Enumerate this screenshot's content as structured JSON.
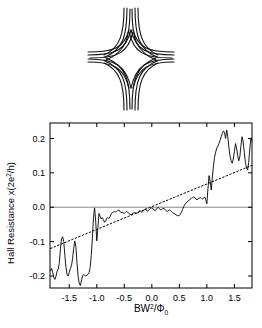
{
  "figure": {
    "device": {
      "name": "hall-cross-device-schematic",
      "description": "Hall cross with curved electron trajectories"
    },
    "chart_data": {
      "type": "line",
      "title": "",
      "subtitle": "",
      "xlabel": "BW2/Φ0",
      "xlabel_parts": {
        "base1": "BW",
        "sup": "2",
        "slash": "/Φ",
        "sub": "0"
      },
      "ylabel": "Hall Resistance x(2e2/h)",
      "ylabel_parts": {
        "text1": "Hall Resistance x(2e",
        "sup": "2",
        "text2": "/h)"
      },
      "xlim": [
        -1.85,
        1.82
      ],
      "ylim": [
        -0.235,
        0.245
      ],
      "xticks": [
        -1.5,
        -1.0,
        -0.5,
        0.0,
        0.5,
        1.0,
        1.5
      ],
      "xticklabels": [
        "-1.5",
        "-1.0",
        "-0.5",
        "0.0",
        "0.5",
        "1.0",
        "1.5"
      ],
      "yticks": [
        0.2,
        0.1,
        0.0,
        -0.1,
        -0.2
      ],
      "yticklabels": [
        "0.2",
        "0.1",
        "0.0",
        "-0.1",
        "-0.2"
      ],
      "grid": false,
      "legend": false,
      "zero_line": {
        "y": 0.0,
        "color": "#888888"
      },
      "series": [
        {
          "name": "Hall resistance trace",
          "style": "solid",
          "color": "#000000",
          "x": [
            -1.84,
            -1.82,
            -1.8,
            -1.78,
            -1.76,
            -1.74,
            -1.72,
            -1.7,
            -1.68,
            -1.66,
            -1.64,
            -1.62,
            -1.6,
            -1.58,
            -1.56,
            -1.54,
            -1.52,
            -1.5,
            -1.48,
            -1.46,
            -1.44,
            -1.42,
            -1.4,
            -1.38,
            -1.36,
            -1.34,
            -1.32,
            -1.3,
            -1.28,
            -1.26,
            -1.24,
            -1.22,
            -1.2,
            -1.18,
            -1.16,
            -1.14,
            -1.12,
            -1.1,
            -1.08,
            -1.06,
            -1.04,
            -1.02,
            -1.0,
            -0.98,
            -0.96,
            -0.94,
            -0.92,
            -0.9,
            -0.88,
            -0.86,
            -0.84,
            -0.82,
            -0.8,
            -0.78,
            -0.76,
            -0.74,
            -0.72,
            -0.7,
            -0.68,
            -0.66,
            -0.64,
            -0.62,
            -0.6,
            -0.58,
            -0.56,
            -0.54,
            -0.52,
            -0.5,
            -0.48,
            -0.46,
            -0.44,
            -0.42,
            -0.4,
            -0.38,
            -0.36,
            -0.34,
            -0.32,
            -0.3,
            -0.28,
            -0.26,
            -0.24,
            -0.22,
            -0.2,
            -0.18,
            -0.16,
            -0.14,
            -0.12,
            -0.1,
            -0.08,
            -0.06,
            -0.04,
            -0.02,
            0.0,
            0.02,
            0.04,
            0.06,
            0.08,
            0.1,
            0.12,
            0.14,
            0.16,
            0.18,
            0.2,
            0.22,
            0.24,
            0.26,
            0.28,
            0.3,
            0.32,
            0.34,
            0.36,
            0.38,
            0.4,
            0.42,
            0.44,
            0.46,
            0.48,
            0.5,
            0.52,
            0.54,
            0.56,
            0.58,
            0.6,
            0.62,
            0.64,
            0.66,
            0.68,
            0.7,
            0.72,
            0.74,
            0.76,
            0.78,
            0.8,
            0.82,
            0.84,
            0.86,
            0.88,
            0.9,
            0.92,
            0.94,
            0.96,
            0.98,
            1.0,
            1.02,
            1.04,
            1.06,
            1.08,
            1.1,
            1.12,
            1.14,
            1.16,
            1.18,
            1.2,
            1.22,
            1.24,
            1.26,
            1.28,
            1.3,
            1.32,
            1.34,
            1.36,
            1.38,
            1.4,
            1.42,
            1.44,
            1.46,
            1.48,
            1.5,
            1.52,
            1.54,
            1.56,
            1.58,
            1.6,
            1.62,
            1.64,
            1.66,
            1.68,
            1.7,
            1.72,
            1.74,
            1.76,
            1.78,
            1.8,
            1.82
          ],
          "y": [
            -0.185,
            -0.178,
            -0.19,
            -0.205,
            -0.21,
            -0.2,
            -0.186,
            -0.18,
            -0.16,
            -0.12,
            -0.092,
            -0.086,
            -0.1,
            -0.14,
            -0.175,
            -0.195,
            -0.2,
            -0.19,
            -0.178,
            -0.17,
            -0.15,
            -0.12,
            -0.098,
            -0.115,
            -0.16,
            -0.2,
            -0.22,
            -0.228,
            -0.215,
            -0.2,
            -0.196,
            -0.198,
            -0.2,
            -0.198,
            -0.195,
            -0.19,
            -0.175,
            -0.14,
            -0.09,
            -0.03,
            -0.002,
            -0.04,
            -0.098,
            -0.06,
            -0.018,
            -0.026,
            -0.034,
            -0.03,
            -0.036,
            -0.044,
            -0.04,
            -0.032,
            -0.03,
            -0.033,
            -0.028,
            -0.02,
            -0.016,
            -0.014,
            -0.012,
            -0.014,
            -0.012,
            -0.01,
            -0.008,
            -0.012,
            -0.016,
            -0.014,
            -0.016,
            -0.018,
            -0.015,
            -0.012,
            -0.014,
            -0.018,
            -0.02,
            -0.022,
            -0.02,
            -0.018,
            -0.015,
            -0.016,
            -0.018,
            -0.016,
            -0.013,
            -0.01,
            -0.012,
            -0.015,
            -0.012,
            -0.008,
            -0.005,
            -0.008,
            -0.012,
            -0.01,
            -0.006,
            -0.003,
            -0.002,
            -0.004,
            -0.008,
            -0.01,
            -0.006,
            -0.002,
            -0.001,
            -0.004,
            -0.008,
            -0.006,
            -0.003,
            -0.004,
            -0.007,
            -0.01,
            -0.012,
            -0.01,
            -0.008,
            -0.01,
            -0.013,
            -0.016,
            -0.018,
            -0.02,
            -0.022,
            -0.024,
            -0.025,
            -0.024,
            -0.02,
            -0.014,
            -0.006,
            0.002,
            0.008,
            0.012,
            0.016,
            0.018,
            0.02,
            0.024,
            0.026,
            0.028,
            0.03,
            0.028,
            0.024,
            0.022,
            0.024,
            0.026,
            0.028,
            0.026,
            0.024,
            0.026,
            0.03,
            0.022,
            0.01,
            0.055,
            0.092,
            0.075,
            0.05,
            0.088,
            0.12,
            0.145,
            0.16,
            0.172,
            0.178,
            0.185,
            0.195,
            0.205,
            0.215,
            0.222,
            0.218,
            0.2,
            0.225,
            0.205,
            0.175,
            0.15,
            0.135,
            0.128,
            0.14,
            0.162,
            0.185,
            0.172,
            0.15,
            0.135,
            0.148,
            0.18,
            0.205,
            0.19,
            0.16,
            0.13,
            0.115,
            0.108,
            0.13,
            0.17,
            0.2,
            0.192
          ]
        },
        {
          "name": "classical linear trend",
          "style": "dotted",
          "color": "#000000",
          "x": [
            -1.84,
            1.82
          ],
          "y": [
            -0.12,
            0.122
          ]
        }
      ]
    }
  }
}
